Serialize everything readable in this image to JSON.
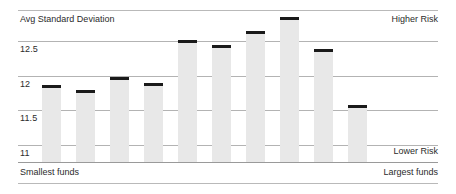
{
  "chart_data": {
    "type": "bar",
    "title": "Avg Standard Deviation",
    "xlabel": "",
    "ylabel": "Avg Standard Deviation",
    "ylim": [
      10.75,
      12.95
    ],
    "grid": true,
    "legend": "none",
    "categories": [
      "1",
      "2",
      "3",
      "4",
      "5",
      "6",
      "7",
      "8",
      "9",
      "10"
    ],
    "values": [
      11.87,
      11.79,
      11.98,
      11.9,
      12.52,
      12.44,
      12.64,
      12.85,
      12.38,
      11.58
    ],
    "yticks": [
      12.5,
      12,
      11.5,
      11
    ],
    "ytick_labels": [
      "12.5",
      "12",
      "11.5",
      "11"
    ],
    "annotations": {
      "top_right": "Higher Risk",
      "bottom_right": "Lower Risk",
      "bottom_left": "Smallest funds",
      "bottom_left_axis_end": "Largest funds"
    },
    "colors": {
      "bar_fill": "#e8e8e8",
      "marker": "#1a1a1a",
      "gridline": "#b3b3b3",
      "text": "#2b2b2b",
      "rule": "#9a9a9a"
    }
  },
  "labels": {
    "title": "Avg Standard Deviation",
    "higher_risk": "Higher Risk",
    "lower_risk": "Lower Risk",
    "smallest_funds": "Smallest funds",
    "largest_funds": "Largest funds"
  }
}
